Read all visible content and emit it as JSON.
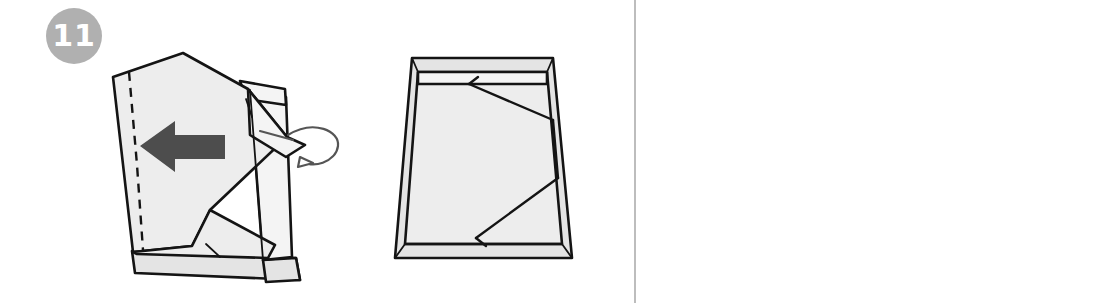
{
  "document": {
    "type": "origami-instruction-diagram",
    "title": "Origami box folding instructions, steps 11 and 12",
    "background_color": "#ffffff",
    "divider_color": "#bdbdbd"
  },
  "palette": {
    "badge_fill": "#b0b0b0",
    "badge_text": "#ffffff",
    "paper_fill": "#ededed",
    "paper_fill_light": "#f4f4f4",
    "paper_fill_shade": "#e4e4e4",
    "outline": "#141414",
    "arrow_fill": "#4d4d4d",
    "symbol_stroke": "#5a5a5a"
  },
  "steps": [
    {
      "number": "11",
      "badge_name": "step-badge-11",
      "figures": [
        {
          "name": "open-box-folding",
          "description": "Partly folded open box seen in three-quarter view with a dashed valley fold line on the left, a solid fold arrow pointing left, and a curved tuck arrow on the right edge",
          "annotations": [
            {
              "kind": "fold-line",
              "style": "dashed",
              "label": "valley-fold-line"
            },
            {
              "kind": "direction-arrow",
              "style": "solid",
              "direction": "left",
              "label": "fold-left-arrow"
            },
            {
              "kind": "tuck-arrow",
              "style": "curved-loop",
              "label": "tuck-into-pocket-arrow"
            }
          ]
        },
        {
          "name": "open-box-top",
          "description": "Completed open box seen from above showing diagonal flap creases across the base",
          "annotations": []
        }
      ]
    },
    {
      "number": "12",
      "badge_name": "step-badge-12",
      "figures": [
        {
          "name": "rotate-symbols",
          "description": "Two process symbols stacked vertically",
          "annotations": [
            {
              "kind": "flip-over-symbol",
              "label": "flip-over-icon",
              "direction": "right"
            },
            {
              "kind": "rotate-symbol",
              "label": "rotate-icon",
              "direction": "clockwise"
            }
          ]
        },
        {
          "name": "closed-box",
          "description": "Finished closed box lid shown in three-quarter perspective view",
          "annotations": []
        }
      ]
    }
  ]
}
